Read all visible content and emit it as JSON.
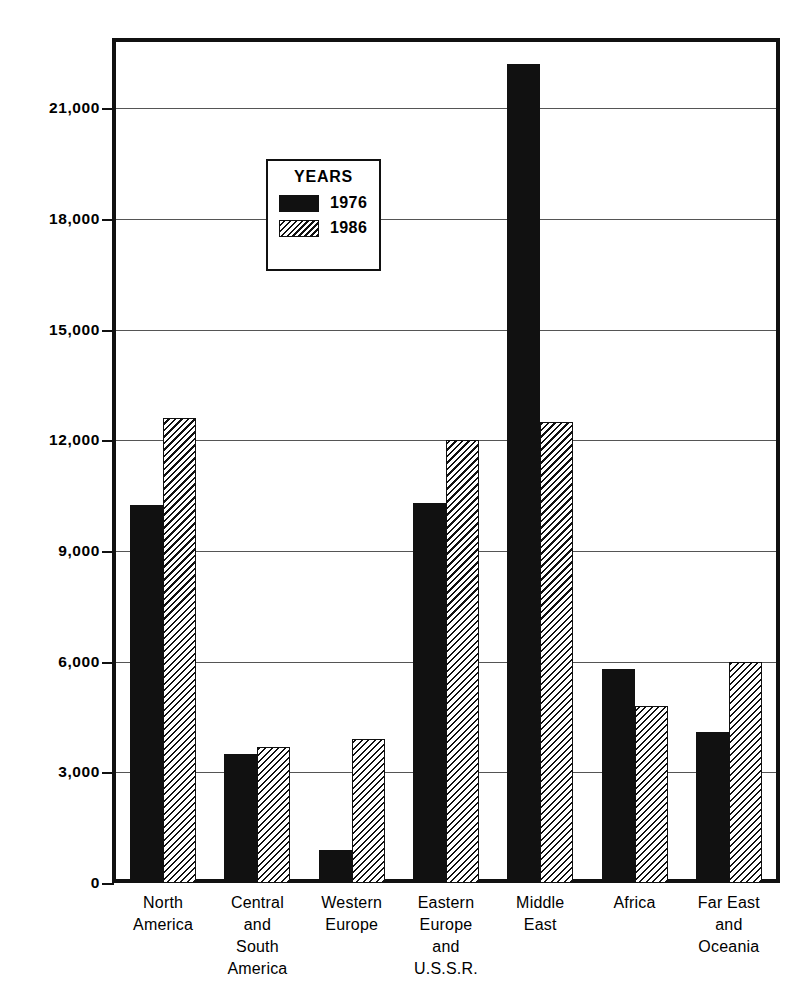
{
  "chart_data": {
    "type": "bar",
    "title": "",
    "subtitle": "",
    "xlabel": "",
    "ylabel": "THOUSAND BARRELS PER DAY",
    "ylim": [
      0,
      22800
    ],
    "yticks": [
      0,
      3000,
      6000,
      9000,
      12000,
      15000,
      18000,
      21000
    ],
    "ytick_labels": [
      "0",
      "3,000",
      "6,000",
      "9,000",
      "12,000",
      "15,000",
      "18,000",
      "21,000"
    ],
    "grid": true,
    "legend_position": "inside-upper-left",
    "categories": [
      "North\nAmerica",
      "Central\nand\nSouth\nAmerica",
      "Western\nEurope",
      "Eastern\nEurope\nand\nU.S.S.R.",
      "Middle\nEast",
      "Africa",
      "Far East\nand\nOceania"
    ],
    "category_labels": [
      [
        "North",
        "America"
      ],
      [
        "Central",
        "and",
        "South",
        "America"
      ],
      [
        "Western",
        "Europe"
      ],
      [
        "Eastern",
        "Europe",
        "and",
        "U.S.S.R."
      ],
      [
        "Middle",
        "East"
      ],
      [
        "Africa"
      ],
      [
        "Far East",
        "and",
        "Oceania"
      ]
    ],
    "series": [
      {
        "name": "1976",
        "fill": "solid-black",
        "color": "#111111",
        "values": [
          10250,
          3500,
          900,
          10300,
          22200,
          5800,
          4100
        ]
      },
      {
        "name": "1986",
        "fill": "diagonal-hatch",
        "color": "#e8e8e8",
        "values": [
          12600,
          3700,
          3900,
          12000,
          12500,
          4800,
          6000
        ]
      }
    ]
  },
  "legend": {
    "title": "YEARS",
    "entries": [
      {
        "label": "1976",
        "swatch": "solid"
      },
      {
        "label": "1986",
        "swatch": "hatch"
      }
    ]
  },
  "axis": {
    "y_title": "THOUSAND BARRELS PER DAY"
  }
}
